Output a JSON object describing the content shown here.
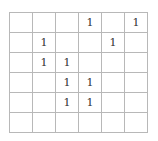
{
  "grid": {
    "rows": 6,
    "cols": 6,
    "cells": [
      [
        "",
        "",
        "",
        "1",
        "",
        "1"
      ],
      [
        "",
        "1",
        "",
        "",
        "1",
        ""
      ],
      [
        "",
        "1",
        "1",
        "",
        "",
        ""
      ],
      [
        "",
        "",
        "1",
        "1",
        "",
        ""
      ],
      [
        "",
        "",
        "1",
        "1",
        "",
        ""
      ],
      [
        "",
        "",
        "",
        "",
        "",
        ""
      ]
    ]
  }
}
